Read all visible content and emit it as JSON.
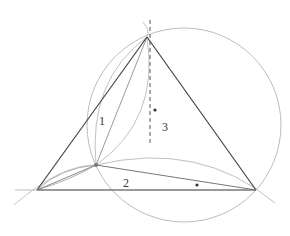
{
  "diagram": {
    "type": "geometric-construction",
    "vertices": {
      "top": [
        147,
        37
      ],
      "left": [
        37,
        190
      ],
      "right": [
        256,
        190
      ],
      "inner": [
        96,
        165
      ]
    },
    "labels": [
      {
        "id": "region-1",
        "text": "1",
        "x": 99,
        "y": 125
      },
      {
        "id": "region-2",
        "text": "2",
        "x": 123,
        "y": 187
      },
      {
        "id": "region-3",
        "text": "3",
        "x": 162,
        "y": 131
      }
    ],
    "marked_points": [
      {
        "id": "dot-circumcenter",
        "x": 155,
        "y": 110
      },
      {
        "id": "dot-base",
        "x": 197,
        "y": 185
      }
    ],
    "big_circle": {
      "cx": 184,
      "cy": 125,
      "r": 97
    },
    "colors": {
      "triangle": "#444444",
      "construction": "#b8b8b8",
      "inner_lines": "#888888",
      "dot": "#333333"
    }
  }
}
